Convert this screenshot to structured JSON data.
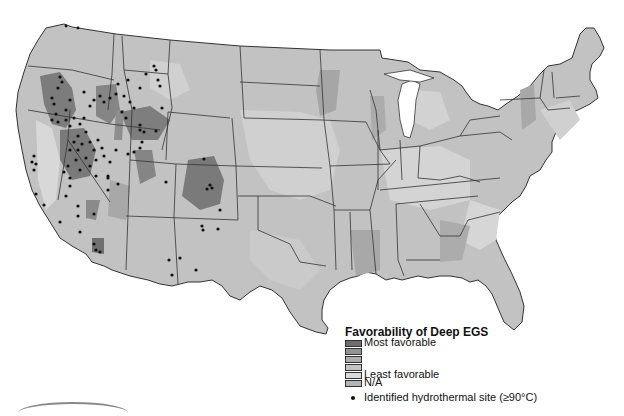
{
  "figure": {
    "caption_fragment": "",
    "map_title": "Favorability of Deep EGS"
  },
  "legend": {
    "title": "Favorability of Deep EGS",
    "classes": [
      {
        "label": "Most favorable",
        "color": "#6e6e6e"
      },
      {
        "label": "",
        "color": "#949494"
      },
      {
        "label": "",
        "color": "#adadad"
      },
      {
        "label": "",
        "color": "#c4c4c4"
      },
      {
        "label": "Least favorable",
        "color": "#dadada"
      },
      {
        "label": "N/A",
        "color": "#b4b4b4"
      }
    ],
    "point_label": "Identified hydrothermal site (≥90°C)",
    "point_color": "#111111"
  },
  "colors": {
    "background": "#ffffff",
    "state_border": "#333333",
    "most_favorable": "#6e6e6e",
    "least_favorable": "#dadada",
    "site_dot": "#111111"
  }
}
